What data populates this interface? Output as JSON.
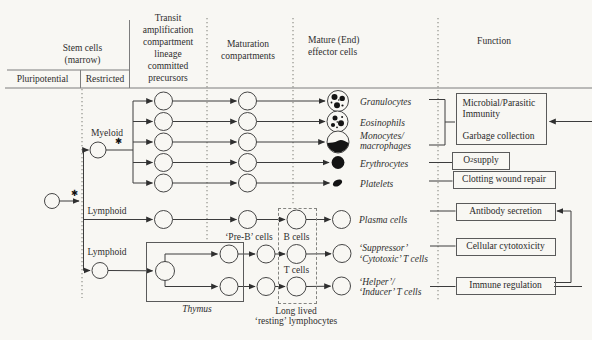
{
  "columns": {
    "stem": {
      "line1": "Stem cells",
      "line2": "(marrow)",
      "sub1": "Pluripotential",
      "sub2": "Restricted"
    },
    "transit": {
      "l1": "Transit",
      "l2": "amplification",
      "l3": "compartment",
      "l4": "lineage",
      "l5": "committed",
      "l6": "precursors"
    },
    "maturation": {
      "l1": "Maturation",
      "l2": "compartments"
    },
    "mature": {
      "l1": "Mature (End)",
      "l2": "effector cells"
    },
    "function_title": "Function"
  },
  "branches": {
    "myeloid": "Myeloid",
    "lymphoid_b": "Lymphoid",
    "lymphoid_t": "Lymphoid",
    "asterisk": "✱"
  },
  "effectors": {
    "granulocytes": "Granulocytes",
    "eosinophils": "Eosinophils",
    "monocytes_l1": "Monocytes/",
    "monocytes_l2": "macrophages",
    "erythrocytes": "Erythrocytes",
    "platelets": "Platelets",
    "plasma": "Plasma cells",
    "suppressor_l1": "‘Suppressor’",
    "suppressor_l2": "‘Cytotoxic’ T cells",
    "helper_l1": "‘Helper’/",
    "helper_l2": "‘Inducer’ T cells"
  },
  "lymphoid": {
    "pre_b": "‘Pre-B’ cells",
    "b_cells": "B cells",
    "t_cells": "T cells",
    "thymus": "Thymus",
    "long_lived_l1": "Long lived",
    "long_lived_l2": "‘resting’ lymphocytes"
  },
  "functions": {
    "microbial_l1": "Microbial/Parasitic",
    "microbial_l2": "Immunity",
    "garbage": "Garbage collection",
    "o2_pre": "O",
    "o2_sub": "2",
    "o2_post": " supply",
    "clotting": "Clotting wound repair",
    "antibody": "Antibody secretion",
    "cellular": "Cellular cytotoxicity",
    "immune": "Immune regulation"
  },
  "colors": {
    "ink": "#3c3c3c",
    "rule": "#7d7d7d",
    "bg": "#f8f7f3"
  }
}
